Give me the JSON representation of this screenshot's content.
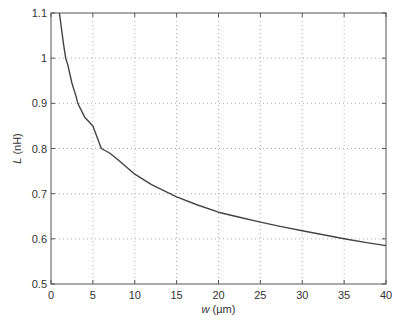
{
  "chart_data": {
    "type": "line",
    "title": "",
    "xlabel_var": "w",
    "xlabel_unit": " (µm)",
    "ylabel_var": "L",
    "ylabel_unit": " (nH)",
    "xlim": [
      0,
      40
    ],
    "ylim": [
      0.5,
      1.1
    ],
    "grid": true,
    "x_ticks": [
      0,
      5,
      10,
      15,
      20,
      25,
      30,
      35,
      40
    ],
    "x_tick_labels": [
      "0",
      "5",
      "10",
      "15",
      "20",
      "25",
      "30",
      "35",
      "40"
    ],
    "y_ticks": [
      0.5,
      0.6,
      0.7,
      0.8,
      0.9,
      1.0,
      1.1
    ],
    "y_tick_labels": [
      "0.5",
      "0.6",
      "0.7",
      "0.8",
      "0.9",
      "1",
      "1.1"
    ],
    "series": [
      {
        "name": "L(w)",
        "color": "#444444",
        "x": [
          1.0,
          1.5,
          1.75,
          2,
          2.5,
          3,
          3.2,
          4,
          5,
          6,
          7,
          8,
          10,
          12,
          15,
          17.5,
          20,
          22.5,
          25,
          27.5,
          30,
          32.5,
          35,
          37.5,
          40
        ],
        "y": [
          1.1,
          1.03,
          1.0,
          0.985,
          0.945,
          0.915,
          0.9,
          0.87,
          0.85,
          0.8,
          0.79,
          0.775,
          0.743,
          0.72,
          0.693,
          0.675,
          0.659,
          0.648,
          0.637,
          0.627,
          0.618,
          0.609,
          0.6,
          0.592,
          0.585
        ]
      }
    ]
  },
  "colors": {
    "axis": "#555555",
    "grid": "#9a9a9a",
    "line": "#444444"
  }
}
